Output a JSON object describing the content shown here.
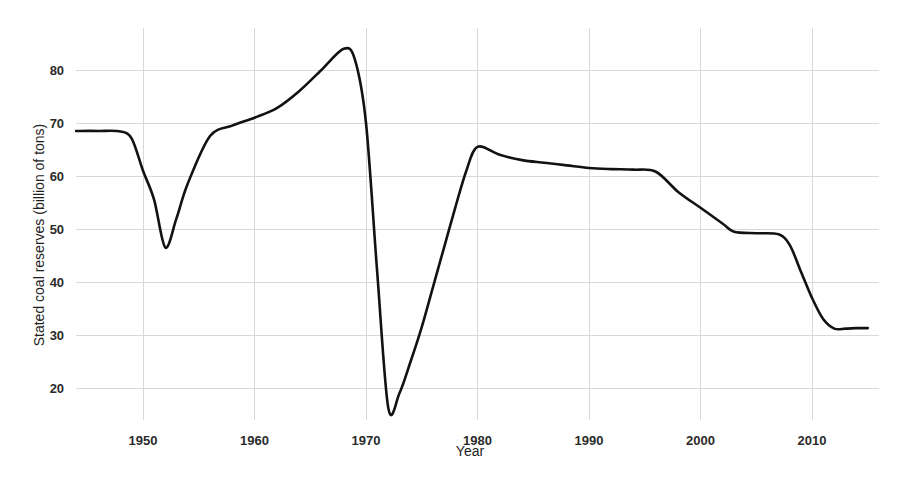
{
  "chart_data": {
    "type": "line",
    "title": "",
    "xlabel": "Year",
    "ylabel": "Stated coal reserves (billion of tons)",
    "xlim": [
      1944,
      2016
    ],
    "ylim": [
      14,
      88
    ],
    "xticks": [
      1950,
      1960,
      1970,
      1980,
      1990,
      2000,
      2010
    ],
    "xtick_labels": [
      "1950",
      "1960",
      "1970",
      "1980",
      "1990",
      "2000",
      "2010"
    ],
    "yticks": [
      20,
      30,
      40,
      50,
      60,
      70,
      80
    ],
    "ytick_labels": [
      "20",
      "30",
      "40",
      "50",
      "60",
      "70",
      "80"
    ],
    "grid": true,
    "grid_color": "#d8d8d8",
    "line_color": "#121212",
    "legend": "none",
    "x": [
      1944,
      1946,
      1948,
      1949,
      1950,
      1951,
      1952,
      1953,
      1954,
      1956,
      1958,
      1960,
      1962,
      1964,
      1966,
      1968,
      1969,
      1970,
      1971,
      1972,
      1973,
      1974,
      1975,
      1976,
      1977,
      1978,
      1979,
      1980,
      1982,
      1984,
      1986,
      1988,
      1990,
      1992,
      1994,
      1996,
      1998,
      2000,
      2002,
      2003,
      2005,
      2007,
      2008,
      2009,
      2010,
      2011,
      2012,
      2013,
      2014,
      2015
    ],
    "y": [
      68.5,
      68.5,
      68.4,
      67.0,
      61.0,
      55.5,
      46.5,
      52.0,
      58.5,
      67.5,
      69.5,
      71.0,
      72.8,
      76.0,
      80.0,
      84.0,
      82.0,
      70.0,
      42.0,
      16.2,
      19.0,
      25.0,
      31.5,
      39.0,
      46.5,
      54.0,
      61.0,
      65.5,
      64.0,
      63.0,
      62.5,
      62.0,
      61.5,
      61.3,
      61.2,
      60.8,
      57.0,
      54.0,
      51.0,
      49.5,
      49.2,
      49.0,
      47.0,
      42.0,
      37.0,
      33.0,
      31.2,
      31.2,
      31.3,
      31.3
    ],
    "series_name": "Stated coal reserves"
  },
  "axis": {
    "x_title": "Year",
    "y_title": "Stated coal reserves (billion of tons)"
  }
}
